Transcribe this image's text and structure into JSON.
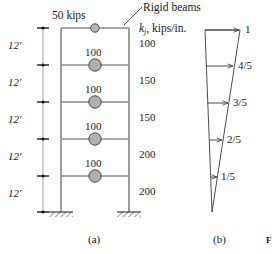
{
  "figure": {
    "panel_a_caption": "(a)",
    "panel_b_caption": "(b)",
    "figure_marker": "F"
  },
  "annotations": {
    "top_load": "50 kips",
    "rigid_beams": "Rigid beams",
    "stiffness_header_symbol": "k",
    "stiffness_header_subscript": "j",
    "stiffness_header_units": ", kips/in."
  },
  "frame": {
    "story_height_label": "12'",
    "story_heights": [
      "12'",
      "12'",
      "12'",
      "12'",
      "12'"
    ],
    "masses": [
      "50 kips",
      "100",
      "100",
      "100",
      "100"
    ],
    "floor_masses_numeric": [
      50,
      100,
      100,
      100,
      100
    ],
    "stiffnesses": [
      "100",
      "150",
      "150",
      "200",
      "200"
    ],
    "stiffnesses_numeric": [
      100,
      150,
      150,
      200,
      200
    ],
    "support_type": "fixed-base",
    "num_stories": 5
  },
  "mode_shape": {
    "labels": [
      "1",
      "4/5",
      "3/5",
      "2/5",
      "1/5"
    ],
    "values": [
      1,
      0.8,
      0.6,
      0.4,
      0.2
    ],
    "description": "linear-first-mode"
  },
  "colors": {
    "line": "#3a3a3a",
    "mass_fill": "#b0b0b0",
    "mass_stroke": "#4a4a4a",
    "text": "#1a1a1a"
  }
}
